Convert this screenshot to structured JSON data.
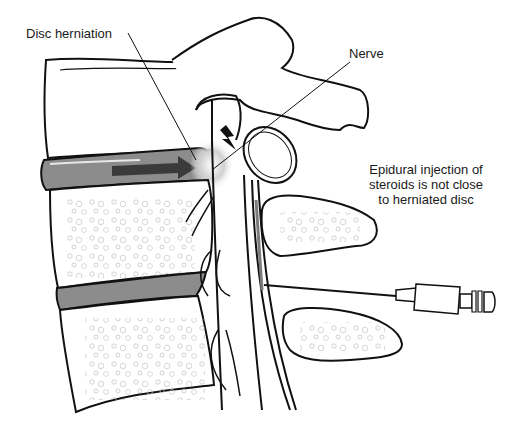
{
  "diagram": {
    "type": "medical-illustration",
    "labels": {
      "disc_herniation": "Disc herniation",
      "nerve": "Nerve",
      "injection_note": [
        "Epidural injection of",
        "steroids is not close",
        "to herniated disc"
      ]
    },
    "colors": {
      "outline": "#111111",
      "disc_fill": "#8c8c8c",
      "arrow_fill": "#3a3a3a",
      "bone_texture": "#b5b5b5",
      "background": "#ffffff"
    }
  }
}
